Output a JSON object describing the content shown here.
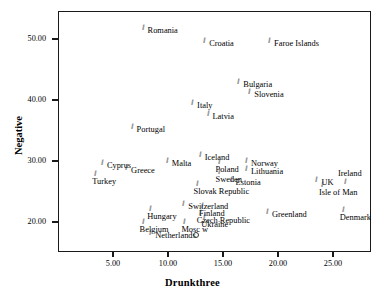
{
  "chart_data": {
    "type": "scatter",
    "title": "",
    "xlabel": "Drunkthree",
    "ylabel": "Negative",
    "xlim": [
      1.4,
      26.8
    ],
    "ylim": [
      17.0,
      54.5
    ],
    "xticks": [
      "5.00",
      "10.00",
      "15.00",
      "20.00",
      "25.00"
    ],
    "xtick_values": [
      5,
      10,
      15,
      20,
      25
    ],
    "yticks": [
      "50.00",
      "40.00",
      "30.00",
      "20.00"
    ],
    "ytick_values": [
      50,
      40,
      30,
      20
    ],
    "grid": false,
    "legend": false,
    "marker": "hash-tick",
    "points": [
      {
        "label": "Romania",
        "x": 7.6,
        "y": 52.5,
        "label_pos": "right"
      },
      {
        "label": "Croatia",
        "x": 13.2,
        "y": 50.3,
        "label_pos": "right"
      },
      {
        "label": "Faroe Islands",
        "x": 19.1,
        "y": 50.3,
        "label_pos": "right"
      },
      {
        "label": "Bulgaria",
        "x": 16.3,
        "y": 43.6,
        "label_pos": "right"
      },
      {
        "label": "Slovenia",
        "x": 17.3,
        "y": 42.0,
        "label_pos": "right"
      },
      {
        "label": "Italy",
        "x": 12.1,
        "y": 40.1,
        "label_pos": "right"
      },
      {
        "label": "Latvia",
        "x": 13.5,
        "y": 38.3,
        "label_pos": "right"
      },
      {
        "label": "Portugal",
        "x": 6.6,
        "y": 36.3,
        "label_pos": "right"
      },
      {
        "label": "Iceland",
        "x": 12.8,
        "y": 31.7,
        "label_pos": "right"
      },
      {
        "label": "Malta",
        "x": 9.8,
        "y": 30.6,
        "label_pos": "right"
      },
      {
        "label": "Norway",
        "x": 17.0,
        "y": 30.6,
        "label_pos": "right"
      },
      {
        "label": "Cyprus",
        "x": 3.9,
        "y": 30.4,
        "label_pos": "right"
      },
      {
        "label": "Poland",
        "x": 14.5,
        "y": 30.5,
        "label_pos": "below"
      },
      {
        "label": "Lithuania",
        "x": 17.0,
        "y": 29.4,
        "label_pos": "right"
      },
      {
        "label": "Greece",
        "x": 6.1,
        "y": 29.5,
        "label_pos": "right"
      },
      {
        "label": "Turkey",
        "x": 3.3,
        "y": 28.5,
        "label_pos": "below"
      },
      {
        "label": "Sweden",
        "x": 14.5,
        "y": 28.8,
        "label_pos": "below"
      },
      {
        "label": "Estonia",
        "x": 15.6,
        "y": 27.5,
        "label_pos": "right"
      },
      {
        "label": "UK",
        "x": 23.4,
        "y": 27.5,
        "label_pos": "right"
      },
      {
        "label": "Ireland",
        "x": 26.0,
        "y": 27.2,
        "label_pos": "above"
      },
      {
        "label": "Isle of Man",
        "x": 23.9,
        "y": 26.8,
        "label_pos": "below"
      },
      {
        "label": "Slovak Republic",
        "x": 12.5,
        "y": 26.9,
        "label_pos": "below"
      },
      {
        "label": "Switzerland",
        "x": 11.3,
        "y": 23.6,
        "label_pos": "right"
      },
      {
        "label": "Finland",
        "x": 13.0,
        "y": 23.3,
        "label_pos": "below"
      },
      {
        "label": "Hungary",
        "x": 8.3,
        "y": 22.8,
        "label_pos": "below"
      },
      {
        "label": "Czech Republic",
        "x": 12.8,
        "y": 22.1,
        "label_pos": "below"
      },
      {
        "label": "Denmark",
        "x": 25.8,
        "y": 22.7,
        "label_pos": "below"
      },
      {
        "label": "Greenland",
        "x": 18.9,
        "y": 22.3,
        "label_pos": "right"
      },
      {
        "label": "Ukraine",
        "x": 13.2,
        "y": 21.4,
        "label_pos": "below"
      },
      {
        "label": "Belgium",
        "x": 7.6,
        "y": 20.6,
        "label_pos": "below"
      },
      {
        "label": "Mosc w",
        "x": 11.4,
        "y": 20.6,
        "label_pos": "below"
      },
      {
        "label": "Netherlands",
        "x": 8.3,
        "y": 18.9,
        "label_pos": "right"
      },
      {
        "label": "",
        "x": 12.3,
        "y": 18.4,
        "label_pos": "right",
        "marker": "circle"
      }
    ]
  }
}
